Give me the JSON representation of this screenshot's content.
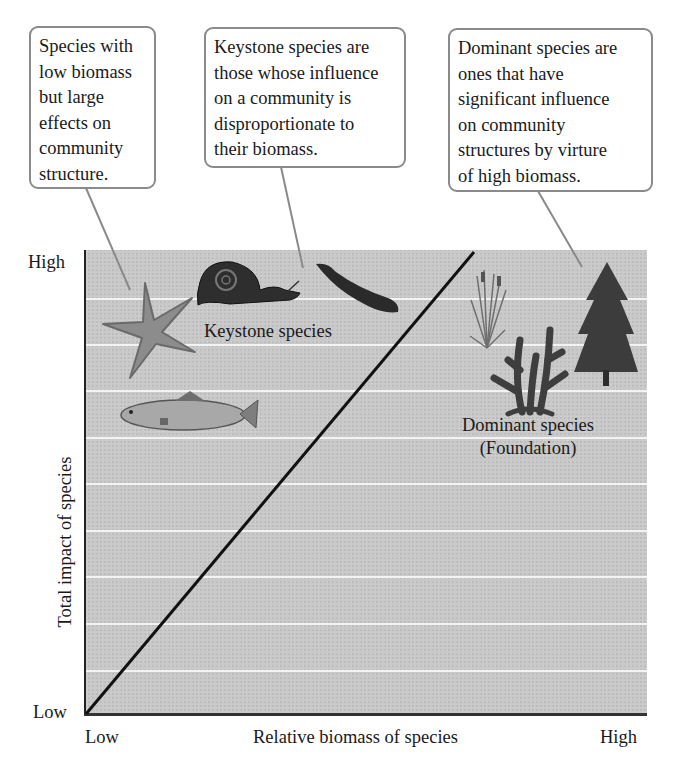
{
  "callouts": [
    {
      "id": "low-biomass",
      "text": "Species with\nlow biomass\nbut large\neffects on\ncommunity\nstructure.",
      "points_to": "starfish"
    },
    {
      "id": "keystone-definition",
      "text": "Keystone species are\nthose whose influence\non a community is\ndisproportionate to\ntheir biomass.",
      "points_to": "snail"
    },
    {
      "id": "dominant-definition",
      "text": "Dominant species are\nones that have\nsignificant influence\non community\nstructures by virture\nof high biomass.",
      "points_to": "conifer-tree"
    }
  ],
  "axes": {
    "x": {
      "title": "Relative biomass of species",
      "low_label": "Low",
      "high_label": "High"
    },
    "y": {
      "title": "Total impact of species",
      "low_label": "Low",
      "high_label": "High"
    }
  },
  "regions": {
    "keystone": {
      "label": "Keystone species",
      "organisms": [
        "starfish",
        "snail",
        "sea otter",
        "trout"
      ]
    },
    "dominant": {
      "label": "Dominant species\n(Foundation)",
      "organisms": [
        "marsh grass",
        "coral",
        "conifer tree"
      ]
    }
  },
  "diagonal": {
    "from": "low biomass, low impact",
    "to": "high impact, moderate biomass"
  },
  "colors": {
    "plot_background": "#c9c9c9",
    "gridline": "#f3f3f3",
    "callout_border": "#8a8a8a",
    "pointer": "#8a8a8a",
    "diagonal": "#111111"
  }
}
